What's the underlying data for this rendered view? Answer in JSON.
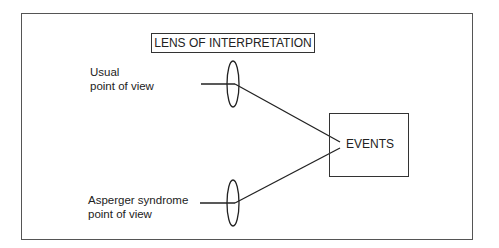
{
  "diagram": {
    "title": "LENS OF INTERPRETATION",
    "viewpoints": [
      {
        "line1": "Usual",
        "line2": "point of view"
      },
      {
        "line1": "Asperger syndrome",
        "line2": "point of view"
      }
    ],
    "target": "EVENTS"
  }
}
